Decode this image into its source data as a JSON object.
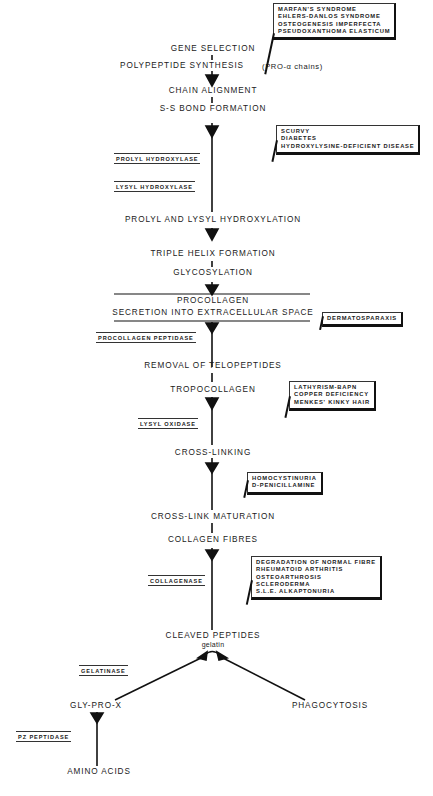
{
  "diagram": {
    "steps": [
      {
        "id": "gene_selection",
        "label": "GENE SELECTION"
      },
      {
        "id": "polypeptide_synthesis",
        "label": "POLYPEPTIDE SYNTHESIS",
        "note": "(PRO-α chains)"
      },
      {
        "id": "chain_alignment",
        "label": "CHAIN ALIGNMENT"
      },
      {
        "id": "ss_bond_formation",
        "label": "S-S BOND FORMATION"
      },
      {
        "id": "prolyl_lysyl_hydroxylation",
        "label": "PROLYL AND LYSYL HYDROXYLATION"
      },
      {
        "id": "triple_helix_formation",
        "label": "TRIPLE HELIX FORMATION"
      },
      {
        "id": "glycosylation",
        "label": "GLYCOSYLATION"
      },
      {
        "id": "procollagen",
        "label": "PROCOLLAGEN"
      },
      {
        "id": "secretion",
        "label": "SECRETION INTO EXTRACELLULAR SPACE"
      },
      {
        "id": "removal_telopeptides",
        "label": "REMOVAL OF TELOPEPTIDES"
      },
      {
        "id": "tropocollagen",
        "label": "TROPOCOLLAGEN"
      },
      {
        "id": "cross_linking",
        "label": "CROSS-LINKING"
      },
      {
        "id": "cross_link_maturation",
        "label": "CROSS-LINK MATURATION"
      },
      {
        "id": "collagen_fibres",
        "label": "COLLAGEN FIBRES"
      },
      {
        "id": "cleaved_peptides",
        "label": "CLEAVED PEPTIDES",
        "sublabel": "gelatin"
      },
      {
        "id": "gly_pro_x",
        "label": "GLY-PRO-X"
      },
      {
        "id": "phagocytosis",
        "label": "PHAGOCYTOSIS"
      },
      {
        "id": "amino_acids",
        "label": "AMINO ACIDS"
      }
    ],
    "enzymes": [
      {
        "id": "prolyl_hydroxylase",
        "label": "PROLYL HYDROXYLASE"
      },
      {
        "id": "lysyl_hydroxylase",
        "label": "LYSYL HYDROXYLASE"
      },
      {
        "id": "procollagen_peptidase",
        "label": "PROCOLLAGEN PEPTIDASE"
      },
      {
        "id": "lysyl_oxidase",
        "label": "LYSYL OXIDASE"
      },
      {
        "id": "collagenase",
        "label": "COLLAGENASE"
      },
      {
        "id": "gelatinase",
        "label": "GELATINASE"
      },
      {
        "id": "pz_peptidase",
        "label": "PZ PEPTIDASE"
      }
    ],
    "disorders": [
      {
        "id": "gene_disorders",
        "items": [
          "MARFAN'S SYNDROME",
          "EHLERS-DANLOS SYNDROME",
          "OSTEOGENESIS IMPERFECTA",
          "PSEUDOXANTHOMA ELASTICUM"
        ]
      },
      {
        "id": "hydroxylation_disorders",
        "items": [
          "SCURVY",
          "DIABETES",
          "HYDROXYLYSINE-DEFICIENT DISEASE"
        ]
      },
      {
        "id": "peptidase_disorders",
        "items": [
          "DERMATOSPARAXIS"
        ]
      },
      {
        "id": "crosslink_disorders",
        "items": [
          "LATHYRISM-BAPN",
          "COPPER DEFICIENCY",
          "MENKES' KINKY HAIR"
        ]
      },
      {
        "id": "maturation_disorders",
        "items": [
          "HOMOCYSTINURIA",
          "D-PENICILLAMINE"
        ]
      },
      {
        "id": "degradation_disorders",
        "items": [
          "DEGRADATION OF NORMAL FIBRE",
          "RHEUMATOID ARTHRITIS",
          "OSTEOARTHROSIS",
          "SCLERODERMA",
          "S.L.E. ALKAPTONURIA"
        ]
      }
    ]
  }
}
